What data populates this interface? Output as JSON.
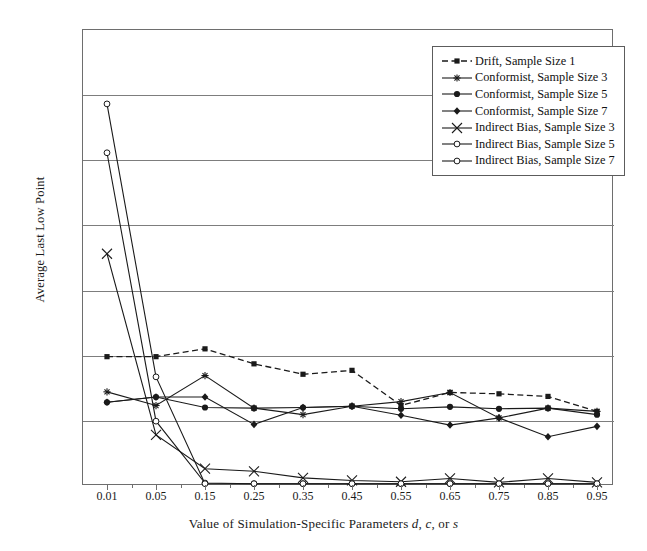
{
  "chart_data": {
    "type": "line",
    "title": "",
    "xlabel": "Value of Simulation-Specific Parameters d, c, or s",
    "ylabel": "Average Last Low Point",
    "categories": [
      "0.01",
      "0.05",
      "0.15",
      "0.25",
      "0.35",
      "0.45",
      "0.55",
      "0.65",
      "0.75",
      "0.85",
      "0.95"
    ],
    "ylim": [
      0,
      0.7
    ],
    "yticks": [
      "0",
      "0.1",
      "0.2",
      "0.3",
      "0.4",
      "0.5",
      "0.6",
      "0.7"
    ],
    "grid": "horizontal",
    "legend_position": "top-right",
    "series": [
      {
        "name": "Drift, Sample Size 1",
        "marker": "filled-square",
        "linestyle": "dashed",
        "values": [
          0.197,
          0.197,
          0.209,
          0.186,
          0.17,
          0.176,
          0.122,
          0.142,
          0.14,
          0.136,
          0.113
        ]
      },
      {
        "name": "Conformist, Sample Size 3",
        "marker": "asterisk",
        "linestyle": "solid",
        "values": [
          0.143,
          0.122,
          0.168,
          0.118,
          0.108,
          0.121,
          0.128,
          0.142,
          0.103,
          0.118,
          0.113
        ]
      },
      {
        "name": "Conformist, Sample Size 5",
        "marker": "filled-circle",
        "linestyle": "solid",
        "values": [
          0.127,
          0.135,
          0.119,
          0.118,
          0.119,
          0.121,
          0.117,
          0.12,
          0.117,
          0.118,
          0.108
        ]
      },
      {
        "name": "Conformist, Sample Size 7",
        "marker": "filled-diamond",
        "linestyle": "solid",
        "values": [
          0.127,
          0.135,
          0.135,
          0.093,
          0.119,
          0.121,
          0.107,
          0.092,
          0.103,
          0.074,
          0.09
        ]
      },
      {
        "name": "Indirect Bias, Sample Size 3",
        "marker": "cross-x",
        "linestyle": "solid",
        "values": [
          0.355,
          0.077,
          0.025,
          0.021,
          0.011,
          0.007,
          0.005,
          0.01,
          0.004,
          0.01,
          0.004
        ]
      },
      {
        "name": "Indirect Bias, Sample Size 5",
        "marker": "open-circle",
        "linestyle": "solid",
        "values": [
          0.51,
          0.098,
          0.003,
          0.002,
          0.002,
          0.002,
          0.002,
          0.002,
          0.002,
          0.002,
          0.002
        ]
      },
      {
        "name": "Indirect Bias, Sample Size 7",
        "marker": "open-circle",
        "linestyle": "solid",
        "values": [
          0.585,
          0.166,
          0.002,
          0.002,
          0.002,
          0.002,
          0.002,
          0.002,
          0.002,
          0.002,
          0.002
        ]
      }
    ]
  },
  "axis": {
    "ylabel": "Average Last Low Point",
    "xlabel_prefix": "Value of Simulation-Specific Parameters ",
    "xlabel_p1": "d",
    "xlabel_sep1": ", ",
    "xlabel_p2": "c",
    "xlabel_sep2": ", or ",
    "xlabel_p3": "s"
  },
  "colors": {
    "line": "#1a1a1a",
    "grid": "#7d7d7d",
    "frame": "#6e6e6e",
    "background": "#ffffff"
  }
}
